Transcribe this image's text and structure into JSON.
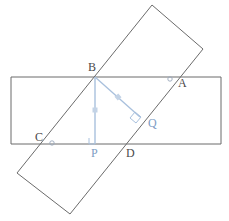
{
  "figure": {
    "background_color": "#ffffff",
    "stroke_color": "#6b6b6b",
    "accent_color": "#a8c0dd",
    "label_color": "#4a4a4a",
    "label_color_blue": "#7d9dc4"
  },
  "shapes": {
    "horizontal_rectangle": {
      "name": "horizontal-rectangle",
      "points": "11,77 221,77 221,144 11,144",
      "stroke": "#6b6b6b"
    },
    "tilted_rectangle": {
      "name": "tilted-rectangle",
      "points": "152,5 203,49 70,214 17,173",
      "stroke": "#6b6b6b"
    }
  },
  "segments": [
    {
      "name": "segment-bp",
      "from": "B",
      "to": "P",
      "x1": 95,
      "y1": 77,
      "x2": 95,
      "y2": 144,
      "stroke": "#a8c0dd"
    },
    {
      "name": "segment-bq",
      "from": "B",
      "to": "Q",
      "x1": 95,
      "y1": 77,
      "x2": 140,
      "y2": 117,
      "stroke": "#a8c0dd"
    }
  ],
  "tick_marks": [
    {
      "name": "tick-on-bp",
      "cx": 95,
      "cy": 110
    },
    {
      "name": "tick-on-bq",
      "cx": 118,
      "cy": 97
    }
  ],
  "right_angle_marks": [
    {
      "name": "right-angle-mark-p",
      "at": "P",
      "points": "89,138 89,144 95,144"
    },
    {
      "name": "right-angle-mark-q",
      "at": "Q",
      "points": "135,113 140,117 136,122 131,118"
    }
  ],
  "point_circles": [
    {
      "name": "point-marker-a",
      "cx": 170,
      "cy": 79,
      "r": 2.2
    },
    {
      "name": "point-marker-c",
      "cx": 52,
      "cy": 143,
      "r": 2.2
    }
  ],
  "labels": [
    {
      "name": "label-b",
      "text": "B",
      "x": 88,
      "y": 71,
      "color": "dark"
    },
    {
      "name": "label-a",
      "text": "A",
      "x": 178,
      "y": 87,
      "color": "dark"
    },
    {
      "name": "label-c",
      "text": "C",
      "x": 35,
      "y": 141,
      "color": "dark"
    },
    {
      "name": "label-q",
      "text": "Q",
      "x": 148,
      "y": 127,
      "color": "blue"
    },
    {
      "name": "label-p",
      "text": "P",
      "x": 91,
      "y": 157,
      "color": "blue"
    },
    {
      "name": "label-d",
      "text": "D",
      "x": 126,
      "y": 157,
      "color": "dark"
    }
  ]
}
